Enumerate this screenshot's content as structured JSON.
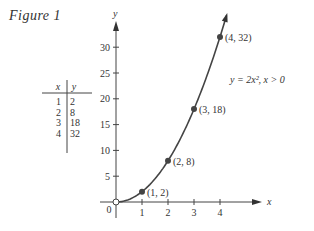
{
  "figure": {
    "title": "Figure 1"
  },
  "table": {
    "headers": [
      "x",
      "y"
    ],
    "rows": [
      [
        "1",
        "2"
      ],
      [
        "2",
        "8"
      ],
      [
        "3",
        "18"
      ],
      [
        "4",
        "32"
      ]
    ]
  },
  "chart_data": {
    "type": "line",
    "title": "Figure 1",
    "xlabel": "x",
    "ylabel": "y",
    "equation_label": "y = 2x², x > 0",
    "x": [
      1,
      2,
      3,
      4
    ],
    "values": [
      2,
      8,
      18,
      32
    ],
    "point_labels": [
      "(1, 2)",
      "(2, 8)",
      "(3, 18)",
      "(4, 32)"
    ],
    "origin_label": "0",
    "origin_marker": "open-circle",
    "xticks": [
      "1",
      "2",
      "3",
      "4"
    ],
    "yticks": [
      "5",
      "10",
      "15",
      "20",
      "25",
      "30"
    ],
    "xlim": [
      0,
      4.5
    ],
    "ylim": [
      0,
      34
    ],
    "grid": false,
    "legend": "none"
  }
}
